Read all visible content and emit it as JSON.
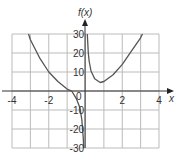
{
  "chart_data": {
    "type": "line",
    "title": "",
    "xlabel": "x",
    "ylabel": "f(x)",
    "xlim": [
      -4,
      4
    ],
    "ylim": [
      -30,
      30
    ],
    "grid": true,
    "x_ticks": [
      "-4",
      "-2",
      "2",
      "4"
    ],
    "y_ticks": [
      "30",
      "20",
      "10",
      "0",
      "-10",
      "-20",
      "-30"
    ],
    "origin_label": "0",
    "series": [
      {
        "name": "f(x) left branch",
        "x": [
          -3.1,
          -3.0,
          -2.5,
          -2.0,
          -1.5,
          -1.0,
          -0.75,
          -0.5,
          -0.3,
          -0.2,
          -0.12,
          -0.1
        ],
        "y": [
          30,
          27,
          17.5,
          10,
          5,
          1,
          0,
          -4,
          -9,
          -15,
          -25,
          -30
        ]
      },
      {
        "name": "f(x) right branch",
        "x": [
          0.1,
          0.15,
          0.2,
          0.3,
          0.5,
          0.8,
          1.0,
          1.5,
          2.0,
          2.5,
          3.0,
          3.1
        ],
        "y": [
          30,
          20,
          15.5,
          10.5,
          6.5,
          4.5,
          5,
          8.5,
          14,
          21,
          28,
          30
        ]
      }
    ],
    "colors": {
      "curve": "#555555",
      "grid": "#bbbbbb",
      "axis": "#333333"
    }
  }
}
